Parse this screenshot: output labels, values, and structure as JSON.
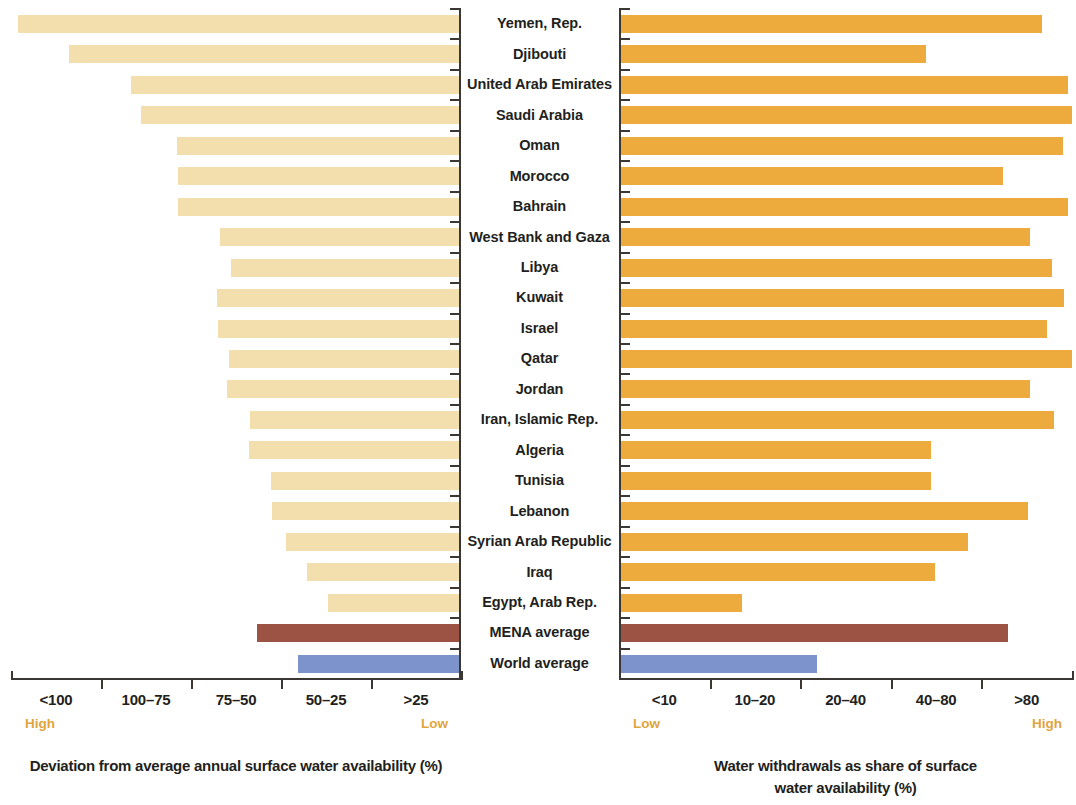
{
  "categories": [
    "Yemen, Rep.",
    "Djibouti",
    "United Arab Emirates",
    "Saudi Arabia",
    "Oman",
    "Morocco",
    "Bahrain",
    "West Bank and Gaza",
    "Libya",
    "Kuwait",
    "Israel",
    "Qatar",
    "Jordan",
    "Iran, Islamic Rep.",
    "Algeria",
    "Tunisia",
    "Lebanon",
    "Syrian Arab Republic",
    "Iraq",
    "Egypt, Arab Rep.",
    "MENA  average",
    "World average"
  ],
  "left_panel": {
    "caption": "Deviation from average annual surface water availability (%)",
    "tick_labels": [
      "<100",
      "100–75",
      "75–50",
      "50–25",
      ">25"
    ],
    "end_label_start": "High",
    "end_label_end": "Low"
  },
  "right_panel": {
    "caption": "Water withdrawals as share of surface\nwater availability (%)",
    "tick_labels": [
      "<10",
      "10–20",
      "20–40",
      "40–80",
      ">80"
    ],
    "end_label_start": "Low",
    "end_label_end": "High"
  },
  "colors": {
    "left_bar": "#f3dfae",
    "right_bar": "#edaa3d",
    "mena_bar": "#9d5343",
    "world_bar": "#7c93cb",
    "axis": "#3a3735",
    "text": "#231f20",
    "accent_label": "#e0a53c"
  },
  "chart_data": {
    "type": "bar",
    "title": "",
    "orientation": "horizontal",
    "layout": "two-panel diverging (left panel bars grow leftward, right panel bars grow rightward, shared category axis in center)",
    "grid": false,
    "legend": "none",
    "categories": [
      "Yemen, Rep.",
      "Djibouti",
      "United Arab Emirates",
      "Saudi Arabia",
      "Oman",
      "Morocco",
      "Bahrain",
      "West Bank and Gaza",
      "Libya",
      "Kuwait",
      "Israel",
      "Qatar",
      "Jordan",
      "Iran, Islamic Rep.",
      "Algeria",
      "Tunisia",
      "Lebanon",
      "Syrian Arab Republic",
      "Iraq",
      "Egypt, Arab Rep.",
      "MENA  average",
      "World average"
    ],
    "series": [
      {
        "name": "Deviation from average annual surface water availability (%)",
        "panel": "left",
        "xlabel": "Deviation from average annual surface water availability (%)",
        "axis_tick_labels": [
          "<100",
          "100–75",
          "75–50",
          "50–25",
          ">25"
        ],
        "axis_direction": "High (left) to Low (right)",
        "bar_color": "#f3dfae",
        "units": "bar length in panel-width fraction, 1.0 = full panel (High)",
        "values": [
          0.985,
          0.87,
          0.733,
          0.71,
          0.63,
          0.628,
          0.628,
          0.535,
          0.51,
          0.542,
          0.54,
          0.515,
          0.518,
          0.467,
          0.47,
          0.422,
          0.418,
          0.387,
          0.34,
          0.294,
          0.452,
          0.361
        ]
      },
      {
        "name": "Water withdrawals as share of surface water availability (%)",
        "panel": "right",
        "xlabel": "Water withdrawals as share of surface water availability (%)",
        "axis_tick_labels": [
          "<10",
          "10–20",
          "20–40",
          "40–80",
          ">80"
        ],
        "axis_direction": "Low (left) to High (right)",
        "bar_color": "#edaa3d",
        "units": "bar length in panel-width fraction, 1.0 = full panel (High)",
        "values": [
          0.933,
          0.678,
          0.992,
          1.0,
          0.98,
          0.848,
          0.992,
          0.906,
          0.955,
          0.982,
          0.945,
          1.0,
          0.908,
          0.96,
          0.689,
          0.689,
          0.902,
          0.77,
          0.696,
          0.27,
          0.858,
          0.436
        ]
      }
    ],
    "special_series_colors": {
      "MENA  average": "#9d5343",
      "World average": "#7c93cb"
    }
  }
}
